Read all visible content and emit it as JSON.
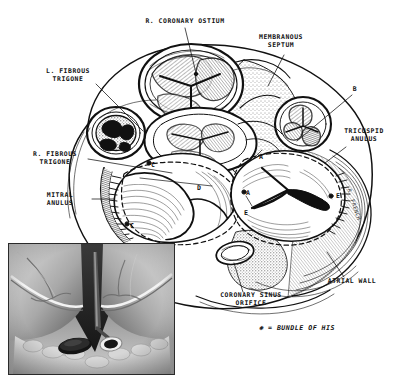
{
  "figure": {
    "background_color": "#ffffff",
    "ink_color": "#111111",
    "legend": {
      "marker": "✻",
      "separator": "=",
      "text": "BUNDLE OF HIS",
      "full": "✻ = BUNDLE OF HIS"
    }
  },
  "labels": [
    {
      "id": "r-coronary-ostium",
      "text": "R. CORONARY OSTIUM",
      "lines": [
        "R. CORONARY OSTIUM"
      ],
      "x": 185,
      "y": 22,
      "align": "center",
      "leader": {
        "x1": 185,
        "y1": 27,
        "x2": 196,
        "y2": 73
      }
    },
    {
      "id": "membranous-septum",
      "text": "MEMBRANOUS SEPTUM",
      "lines": [
        "MEMBRANOUS",
        "SEPTUM"
      ],
      "x": 281,
      "y": 38,
      "align": "center",
      "leader": {
        "x1": 284,
        "y1": 55,
        "x2": 268,
        "y2": 86
      }
    },
    {
      "id": "l-fibrous-trigone",
      "text": "L. FIBROUS TRIGONE",
      "lines": [
        "L. FIBROUS",
        "TRIGONE"
      ],
      "x": 68,
      "y": 72,
      "align": "center",
      "leader": {
        "x1": 94,
        "y1": 83,
        "x2": 142,
        "y2": 131
      }
    },
    {
      "id": "r-fibrous-trigone",
      "text": "R. FIBROUS TRIGONE",
      "lines": [
        "R. FIBROUS",
        "TRIGONE"
      ],
      "x": 55,
      "y": 155,
      "align": "center",
      "leader": {
        "x1": 86,
        "y1": 159,
        "x2": 171,
        "y2": 172
      }
    },
    {
      "id": "mitral-anulus",
      "text": "MITRAL ANULUS",
      "lines": [
        "MITRAL",
        "ANULUS"
      ],
      "x": 60,
      "y": 196,
      "align": "center",
      "leader": {
        "x1": 90,
        "y1": 199,
        "x2": 113,
        "y2": 199
      }
    },
    {
      "id": "tricuspid-anulus",
      "text": "TRICUSPID ANULUS",
      "lines": [
        "TRICUSPID",
        "ANULUS"
      ],
      "x": 364,
      "y": 132,
      "align": "center",
      "leader": {
        "x1": 346,
        "y1": 147,
        "x2": 326,
        "y2": 162
      }
    },
    {
      "id": "atrial-wall",
      "text": "ATRIAL WALL",
      "lines": [
        "ATRIAL WALL"
      ],
      "x": 352,
      "y": 281,
      "align": "center",
      "leader": {
        "x1": 344,
        "y1": 277,
        "x2": 326,
        "y2": 252
      }
    },
    {
      "id": "coronary-sinus-orifice",
      "text": "CORONARY SINUS ORIFICE",
      "lines": [
        "CORONARY SINUS",
        "ORIFICE"
      ],
      "x": 251,
      "y": 296,
      "align": "center",
      "leader": {
        "x1": 242,
        "y1": 292,
        "x2": 234,
        "y2": 262
      }
    },
    {
      "id": "point-b",
      "text": "B",
      "lines": [
        "B"
      ],
      "x": 355,
      "y": 89,
      "align": "center",
      "leader": {
        "x1": 354,
        "y1": 95,
        "x2": 297,
        "y2": 140
      }
    }
  ],
  "point_markers": [
    {
      "id": "point-a-upper",
      "text": "A",
      "x": 262,
      "y": 158
    },
    {
      "id": "point-a-lower",
      "text": "A",
      "x": 248,
      "y": 194
    },
    {
      "id": "point-c-upper",
      "text": "C",
      "x": 153,
      "y": 166
    },
    {
      "id": "point-c-lower",
      "text": "C",
      "x": 131,
      "y": 227
    },
    {
      "id": "point-d",
      "text": "D",
      "x": 199,
      "y": 189
    },
    {
      "id": "point-e-left",
      "text": "E",
      "x": 246,
      "y": 214
    },
    {
      "id": "point-e-right",
      "text": "E",
      "x": 337,
      "y": 197
    }
  ],
  "bundle_of_his_markers": [
    {
      "id": "his-marker-1",
      "x": 149,
      "y": 163
    },
    {
      "id": "his-marker-2",
      "x": 127,
      "y": 224
    },
    {
      "id": "his-marker-3",
      "x": 244,
      "y": 192
    },
    {
      "id": "his-marker-4",
      "x": 331,
      "y": 196
    }
  ],
  "inset": {
    "id": "operative-photograph",
    "caption": "",
    "x": 8,
    "y": 243,
    "width": 165,
    "height": 130,
    "border_color": "#2a2a2a",
    "description": "Intraoperative photograph of the right atrial aspect showing the triangle of Koch with the coronary sinus orifice and a probe"
  },
  "signature": {
    "text": "R. FRENCH",
    "x": 352,
    "y": 188
  },
  "top_ghost_text": [
    {
      "text": "",
      "x": 140,
      "y": 0
    },
    {
      "text": "",
      "x": 228,
      "y": 0
    }
  ]
}
